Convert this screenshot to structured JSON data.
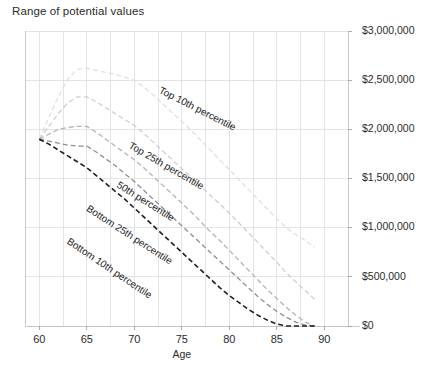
{
  "chart_data": {
    "type": "line",
    "title": "Range of potential values",
    "xlabel": "Age",
    "ylabel": "",
    "xlim": [
      58.5,
      92.5
    ],
    "ylim": [
      0,
      3000000
    ],
    "grid": true,
    "legend_position": "inline-labels",
    "x_ticks": [
      60,
      65,
      70,
      75,
      80,
      85,
      90
    ],
    "x_tick_labels": [
      "60",
      "65",
      "70",
      "75",
      "80",
      "85",
      "90"
    ],
    "x_gridlines": [
      60,
      62.5,
      65,
      67.5,
      70,
      72.5,
      75,
      77.5,
      80,
      82.5,
      85,
      87.5,
      90
    ],
    "y_ticks": [
      0,
      500000,
      1000000,
      1500000,
      2000000,
      2500000,
      3000000
    ],
    "y_tick_labels": [
      "$0",
      "$500,000",
      "$1,000,000",
      "$1,500,000",
      "$2,000,000",
      "$2,500,000",
      "$3,000,000"
    ],
    "y_axis_side": "right",
    "x": [
      60,
      61,
      62,
      63,
      64,
      65,
      66,
      67,
      68,
      69,
      70,
      71,
      72,
      73,
      74,
      75,
      76,
      77,
      78,
      79,
      80,
      81,
      82,
      83,
      84,
      85,
      86,
      87,
      88,
      89
    ],
    "series": [
      {
        "name": "Top 10th percentile",
        "label": "Top 10th percentile",
        "color": "#e0e0e0",
        "width": 1.3,
        "dash": "5,3",
        "label_x": 76.5,
        "label_y": 2180000,
        "label_rotation": 27,
        "values": [
          1900000,
          2120000,
          2330000,
          2510000,
          2610000,
          2620000,
          2600000,
          2580000,
          2560000,
          2530000,
          2500000,
          2430000,
          2350000,
          2260000,
          2170000,
          2080000,
          1990000,
          1890000,
          1790000,
          1690000,
          1590000,
          1490000,
          1390000,
          1290000,
          1190000,
          1090000,
          1000000,
          930000,
          870000,
          800000
        ]
      },
      {
        "name": "Top 25th percentile",
        "label": "Top 25th percentile",
        "color": "#cfcfcf",
        "width": 1.3,
        "dash": "5,3",
        "label_x": 73.2,
        "label_y": 1600000,
        "label_rotation": 30,
        "values": [
          1900000,
          2030000,
          2160000,
          2270000,
          2330000,
          2330000,
          2280000,
          2220000,
          2160000,
          2100000,
          2040000,
          1960000,
          1870000,
          1780000,
          1690000,
          1600000,
          1510000,
          1420000,
          1330000,
          1240000,
          1150000,
          1050000,
          950000,
          850000,
          750000,
          650000,
          540000,
          450000,
          360000,
          270000
        ]
      },
      {
        "name": "50th percentile",
        "label": "50th percentile",
        "color": "#b4b4b4",
        "width": 1.3,
        "dash": "5,3",
        "label_x": 71.0,
        "label_y": 1240000,
        "label_rotation": 32,
        "values": [
          1900000,
          1950000,
          2000000,
          2020000,
          2030000,
          2030000,
          1970000,
          1900000,
          1830000,
          1760000,
          1690000,
          1610000,
          1520000,
          1430000,
          1340000,
          1250000,
          1160000,
          1060000,
          960000,
          870000,
          770000,
          670000,
          570000,
          470000,
          370000,
          280000,
          190000,
          110000,
          40000,
          0
        ]
      },
      {
        "name": "Bottom 25th percentile",
        "label": "Bottom 25th percentile",
        "color": "#8f8f8f",
        "width": 1.3,
        "dash": "5,3",
        "label_x": 69.3,
        "label_y": 900000,
        "label_rotation": 33,
        "values": [
          1900000,
          1880000,
          1860000,
          1840000,
          1830000,
          1830000,
          1770000,
          1700000,
          1630000,
          1550000,
          1470000,
          1380000,
          1290000,
          1200000,
          1110000,
          1020000,
          930000,
          840000,
          750000,
          660000,
          570000,
          480000,
          390000,
          300000,
          220000,
          150000,
          90000,
          40000,
          10000,
          0
        ]
      },
      {
        "name": "Bottom 10th percentile",
        "label": "Bottom 10th percentile",
        "color": "#1f1f1f",
        "width": 1.6,
        "dash": "5,3",
        "label_x": 67.2,
        "label_y": 560000,
        "label_rotation": 34,
        "values": [
          1900000,
          1850000,
          1790000,
          1730000,
          1670000,
          1610000,
          1530000,
          1450000,
          1370000,
          1290000,
          1200000,
          1110000,
          1020000,
          930000,
          840000,
          750000,
          660000,
          570000,
          480000,
          390000,
          310000,
          240000,
          170000,
          110000,
          60000,
          20000,
          0,
          0,
          0,
          0
        ]
      }
    ]
  }
}
